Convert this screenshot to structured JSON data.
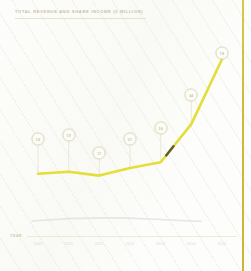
{
  "document": {
    "title": "TOTAL REVENUE AND SHARE INCOME (€ MILLION)",
    "year_axis_label": "YEAR",
    "accent_rule_color": "#cdbb37",
    "line_color": "#e3de3a",
    "bubble_text_color": "#cfc79e",
    "shadow_color": "#dfe2e6"
  },
  "chart_data": {
    "type": "line",
    "title": "TOTAL REVENUE AND SHARE INCOME (€ MILLION)",
    "xlabel": "YEAR",
    "ylabel": "",
    "grid": false,
    "legend": "none",
    "categories": [
      "2009",
      "2010",
      "2011",
      "2012",
      "2013",
      "2014",
      "2015"
    ],
    "values": [
      18,
      19,
      17,
      21,
      24,
      44,
      78
    ],
    "ylim": [
      0,
      85
    ],
    "annotations": [
      {
        "category": "2009",
        "label": "18"
      },
      {
        "category": "2010",
        "label": "19"
      },
      {
        "category": "2011",
        "label": "17"
      },
      {
        "category": "2012",
        "label": "21"
      },
      {
        "category": "2013",
        "label": "24"
      },
      {
        "category": "2014",
        "label": "44"
      },
      {
        "category": "2015",
        "label": "78"
      }
    ],
    "series": [
      {
        "name": "Total revenue and share income",
        "values": [
          18,
          19,
          17,
          21,
          24,
          44,
          78
        ]
      }
    ]
  }
}
